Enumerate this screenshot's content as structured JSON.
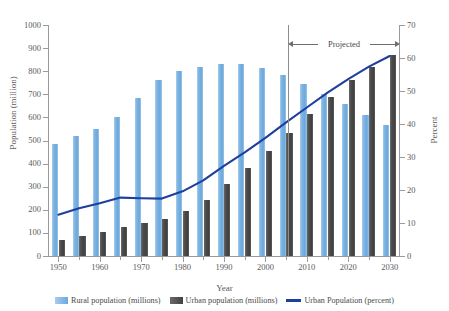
{
  "chart_data": {
    "type": "bar",
    "title": "",
    "xlabel": "Year",
    "ylabel": "Population (million)",
    "y2label": "Percent",
    "ylim": [
      0,
      1000
    ],
    "y2lim": [
      0,
      70
    ],
    "xlim": [
      1947.5,
      2032.5
    ],
    "grid": false,
    "legend_position": "bottom",
    "categories": [
      1950,
      1955,
      1960,
      1965,
      1970,
      1975,
      1980,
      1985,
      1990,
      1995,
      2000,
      2005,
      2010,
      2015,
      2020,
      2025,
      2030
    ],
    "xticks": [
      1950,
      1960,
      1970,
      1980,
      1990,
      2000,
      2010,
      2020,
      2030
    ],
    "yticks": [
      0,
      100,
      200,
      300,
      400,
      500,
      600,
      700,
      800,
      900,
      1000
    ],
    "y2ticks": [
      0,
      10,
      20,
      30,
      40,
      50,
      60,
      70
    ],
    "series": [
      {
        "name": "Rural population (millions)",
        "type": "bar",
        "axis": "left",
        "color": "#7fb4e2",
        "values": [
          485,
          520,
          550,
          600,
          685,
          763,
          800,
          820,
          833,
          830,
          813,
          783,
          745,
          703,
          660,
          612,
          567
        ]
      },
      {
        "name": "Urban population (millions)",
        "type": "bar",
        "axis": "left",
        "color": "#4d4d4d",
        "values": [
          70,
          88,
          105,
          127,
          143,
          160,
          195,
          243,
          313,
          380,
          453,
          532,
          613,
          690,
          762,
          818,
          872
        ]
      },
      {
        "name": "Urban Population (percent)",
        "type": "line",
        "axis": "right",
        "color": "#1f3f9e",
        "values": [
          12.5,
          14.5,
          16.0,
          17.7,
          17.5,
          17.4,
          19.6,
          22.9,
          27.3,
          31.4,
          35.8,
          40.5,
          45.0,
          49.5,
          53.6,
          57.4,
          60.6
        ]
      }
    ],
    "annotations": [
      {
        "text": "Projected",
        "from_year": 2005,
        "to_year": 2030,
        "style": "double-arrow-bracket"
      }
    ]
  },
  "axes": {
    "left": {
      "title": "Population (million)",
      "ticks": [
        "0",
        "100",
        "200",
        "300",
        "400",
        "500",
        "600",
        "700",
        "800",
        "900",
        "1000"
      ]
    },
    "right": {
      "title": "Percent",
      "ticks": [
        "0",
        "10",
        "20",
        "30",
        "40",
        "50",
        "60",
        "70"
      ]
    },
    "bottom": {
      "title": "Year",
      "ticks": [
        "1950",
        "1960",
        "1970",
        "1980",
        "1990",
        "2000",
        "2010",
        "2020",
        "2030"
      ]
    }
  },
  "legend": {
    "items": [
      {
        "label": "Rural population (millions)",
        "marker": "square-swatch",
        "color": "#7fb4e2"
      },
      {
        "label": "Urban population (millions)",
        "marker": "square-swatch",
        "color": "#4d4d4d"
      },
      {
        "label": "Urban Population (percent)",
        "marker": "line-swatch",
        "color": "#1f3f9e"
      }
    ]
  },
  "annotation": {
    "projected_label": "Projected"
  },
  "colors": {
    "rural_bar": "#7fb4e2",
    "urban_bar": "#4d4d4d",
    "percent_line": "#1f3f9e",
    "axis": "#9b9b9b",
    "text": "#4a4a4a",
    "background": "#ffffff"
  }
}
